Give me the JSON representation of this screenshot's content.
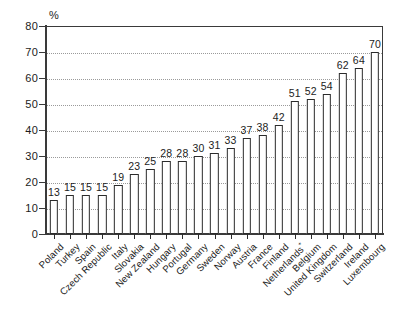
{
  "chart_data": {
    "type": "bar",
    "title": "",
    "subtitle": "",
    "xlabel": "",
    "ylabel": "%",
    "ylim": [
      0,
      80
    ],
    "yticks": [
      0,
      10,
      20,
      30,
      40,
      50,
      60,
      70,
      80
    ],
    "grid": true,
    "legend": "none",
    "orientation": "vertical",
    "bar_style": {
      "fill": "#ffffff",
      "edge": "#2b2b2b"
    },
    "categories": [
      "Poland",
      "Turkey",
      "Spain",
      "Czech Republic",
      "Italy",
      "Slovakia",
      "New Zealand",
      "Hungary",
      "Portugal",
      "Germany",
      "Sweden",
      "Norway",
      "Austria",
      "France",
      "Finland",
      "Netherlands*",
      "Belgium",
      "United Kingdom",
      "Switzerland",
      "Ireland",
      "Luxembourg"
    ],
    "values": [
      13,
      15,
      15,
      15,
      19,
      23,
      25,
      28,
      28,
      30,
      31,
      33,
      37,
      38,
      42,
      51,
      52,
      54,
      62,
      64,
      70
    ],
    "data_labels": [
      "13",
      "15",
      "15",
      "15",
      "19",
      "23",
      "25",
      "28",
      "28",
      "30",
      "31",
      "33",
      "37",
      "38",
      "42",
      "51",
      "52",
      "54",
      "62",
      "64",
      "70"
    ],
    "footnote_marker": "*",
    "axis_unit_label": "%"
  }
}
